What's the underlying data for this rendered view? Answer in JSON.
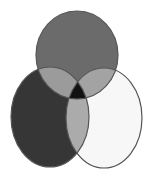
{
  "diagram": {
    "type": "venn",
    "sets": [
      {
        "id": "top",
        "cx": 77,
        "cy": 55,
        "rx": 41,
        "ry": 44,
        "fill": "#6b6b6b"
      },
      {
        "id": "left",
        "cx": 50,
        "cy": 117,
        "rx": 39,
        "ry": 50,
        "fill": "#363636"
      },
      {
        "id": "right",
        "cx": 104,
        "cy": 118,
        "rx": 38,
        "ry": 50,
        "fill": "#f7f7f7"
      }
    ],
    "intersections": {
      "top_left": "#9b9b9b",
      "top_right": "#a3a3a3",
      "left_right": "#ababab",
      "all": "#121212"
    },
    "stroke": "#555555",
    "background": "#ffffff"
  }
}
